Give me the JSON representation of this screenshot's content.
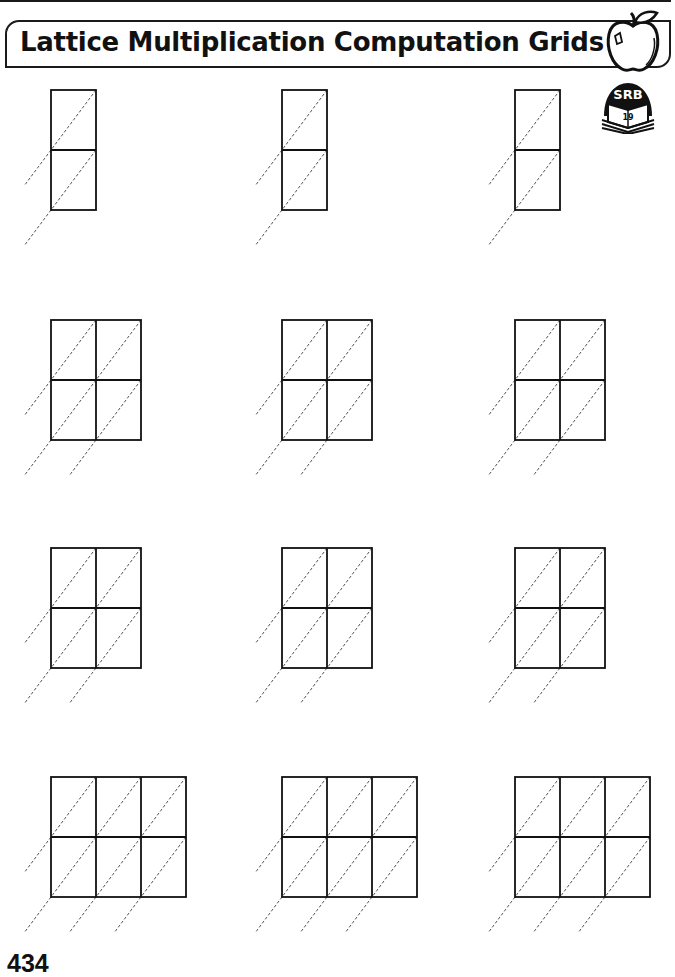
{
  "header": {
    "title": "Lattice Multiplication Computation Grids",
    "apple_icon": "apple-icon",
    "srb_badge": {
      "label": "SRB",
      "page_ref": "19",
      "icon": "book-icon"
    }
  },
  "grid_layout": {
    "cell_width": 45,
    "cell_height": 60,
    "column_x": [
      51,
      282,
      515
    ],
    "diagonal_extension": {
      "dx": 27,
      "dy": 36
    }
  },
  "grid_rows": [
    {
      "top": 90,
      "cols": 1,
      "rows": 2,
      "count": 3
    },
    {
      "top": 320,
      "cols": 2,
      "rows": 2,
      "count": 3
    },
    {
      "top": 548,
      "cols": 2,
      "rows": 2,
      "count": 3
    },
    {
      "top": 777,
      "cols": 3,
      "rows": 2,
      "count": 3
    }
  ],
  "footer": {
    "page_number": "434"
  }
}
